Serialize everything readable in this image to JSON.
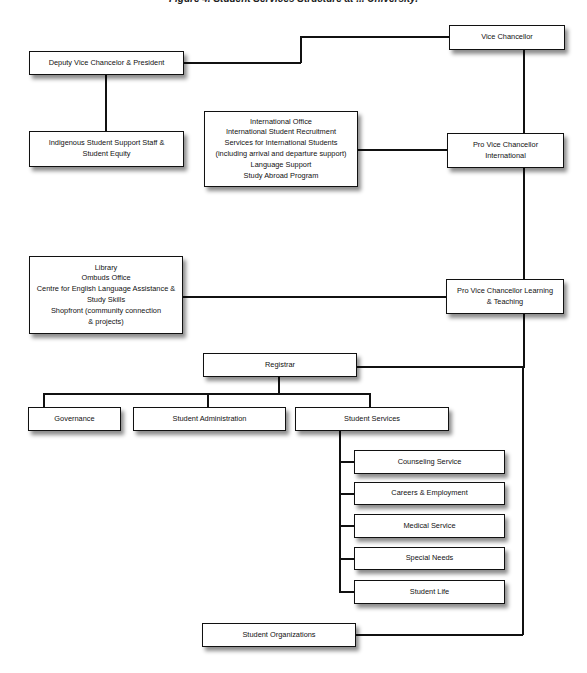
{
  "caption": "Figure 4. Student Services Structure at ... University.",
  "nodes": {
    "vice_chancellor": "Vice Chancellor",
    "deputy_vc": "Deputy Vice Chancelor & President",
    "indigenous": [
      "Indigenous Student Support Staff &",
      "Student Equity"
    ],
    "international_group": [
      "International Office",
      "International Student Recruitment",
      "Services for International Students",
      "(including arrival and departure support)",
      "Language Support",
      "Study Abroad Program"
    ],
    "pvc_international": [
      "Pro Vice Chancellor",
      "International"
    ],
    "learning_group": [
      "Library",
      "Ombuds Office",
      "Centre for English Language Assistance &",
      "Study Skills",
      "Shopfront (community connection",
      "& projects)"
    ],
    "pvc_learning": [
      "Pro Vice Chancellor Learning",
      "& Teaching"
    ],
    "registrar": "Registrar",
    "governance": "Governance",
    "student_administration": "Student Administration",
    "student_services": "Student Services",
    "student_services_units": [
      "Counseling Service",
      "Careers & Employment",
      "Medical Service",
      "Special Needs",
      "Student Life"
    ],
    "student_organizations": "Student Organizations"
  }
}
